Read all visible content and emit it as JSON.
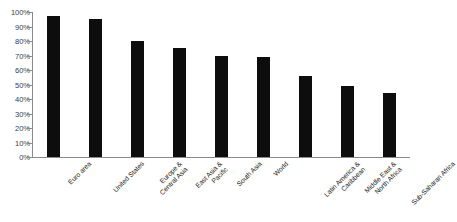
{
  "chart_data": {
    "type": "bar",
    "title": "",
    "subtitle": "",
    "xlabel": "",
    "ylabel": "",
    "ylim": [
      0,
      100
    ],
    "grid": false,
    "legend": false,
    "bar_color": "#0d0d0d",
    "axis_color": "#8a8a8a",
    "value_suffix": "%",
    "categories": [
      "Euro area",
      "United States",
      "Europe & Central Asia",
      "East Asia & Pacific",
      "South Asia",
      "World",
      "Latin America & Caribbean",
      "Middle East & North Africa",
      "Sub-Saharan Africa"
    ],
    "values": [
      97,
      95,
      80,
      75,
      70,
      69,
      56,
      49,
      44
    ],
    "ytick_labels": [
      "100%",
      "90%",
      "80%",
      "70%",
      "60%",
      "50%",
      "40%",
      "30%",
      "20%",
      "10%",
      "0%"
    ],
    "ytick_values": [
      100,
      90,
      80,
      70,
      60,
      50,
      40,
      30,
      20,
      10,
      0
    ]
  }
}
